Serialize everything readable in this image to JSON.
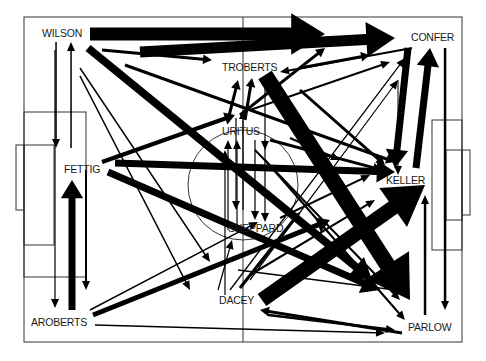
{
  "diagram": {
    "pitch": {
      "outer": [
        24,
        17,
        438,
        325
      ],
      "halfway_x": 243,
      "center": [
        243,
        185
      ],
      "center_radius": 55,
      "left_box": [
        24,
        112,
        62,
        165
      ],
      "left_six": [
        24,
        145,
        30,
        100
      ],
      "left_goal": [
        16,
        145,
        8,
        65
      ],
      "right_box": [
        432,
        120,
        30,
        130
      ],
      "right_six": [
        446,
        150,
        16,
        70
      ],
      "right_goal": [
        462,
        150,
        8,
        65
      ]
    },
    "players": [
      {
        "name": "WILSON",
        "x": 42,
        "y": 27
      },
      {
        "name": "CONFER",
        "x": 411,
        "y": 31
      },
      {
        "name": "TROBERTS",
        "x": 222,
        "y": 61
      },
      {
        "name": "URITUS",
        "x": 222,
        "y": 125
      },
      {
        "name": "FETTIG",
        "x": 64,
        "y": 163
      },
      {
        "name": "KELLER",
        "x": 386,
        "y": 174
      },
      {
        "name": "SHEPPARD",
        "x": 228,
        "y": 222
      },
      {
        "name": "DACEY",
        "x": 219,
        "y": 294
      },
      {
        "name": "AROBERTS",
        "x": 31,
        "y": 316
      },
      {
        "name": "PARLOW",
        "x": 408,
        "y": 321
      }
    ],
    "arrows": [
      {
        "from": [
          90,
          34
        ],
        "to": [
          325,
          34
        ],
        "w": 13
      },
      {
        "from": [
          140,
          52
        ],
        "to": [
          395,
          38
        ],
        "w": 11
      },
      {
        "from": [
          88,
          48
        ],
        "to": [
          372,
          280
        ],
        "w": 8
      },
      {
        "from": [
          102,
          50
        ],
        "to": [
          212,
          60
        ],
        "w": 3
      },
      {
        "from": [
          125,
          65
        ],
        "to": [
          395,
          162
        ],
        "w": 3
      },
      {
        "from": [
          80,
          68
        ],
        "to": [
          210,
          262
        ],
        "w": 1.5
      },
      {
        "from": [
          80,
          76
        ],
        "to": [
          190,
          290
        ],
        "w": 1.5
      },
      {
        "from": [
          56,
          42
        ],
        "to": [
          56,
          148
        ],
        "w": 1.5
      },
      {
        "from": [
          71,
          148
        ],
        "to": [
          71,
          42
        ],
        "w": 1.5
      },
      {
        "from": [
          55,
          50
        ],
        "to": [
          55,
          308
        ],
        "w": 1.2
      },
      {
        "from": [
          102,
          162
        ],
        "to": [
          235,
          115
        ],
        "w": 4
      },
      {
        "from": [
          115,
          163
        ],
        "to": [
          395,
          172
        ],
        "w": 7
      },
      {
        "from": [
          108,
          172
        ],
        "to": [
          380,
          290
        ],
        "w": 7
      },
      {
        "from": [
          72,
          310
        ],
        "to": [
          72,
          180
        ],
        "w": 7
      },
      {
        "from": [
          86,
          170
        ],
        "to": [
          86,
          290
        ],
        "w": 2
      },
      {
        "from": [
          90,
          310
        ],
        "to": [
          258,
          222
        ],
        "w": 1.5
      },
      {
        "from": [
          93,
          315
        ],
        "to": [
          330,
          220
        ],
        "w": 5
      },
      {
        "from": [
          95,
          325
        ],
        "to": [
          385,
          333
        ],
        "w": 1.5
      },
      {
        "from": [
          265,
          75
        ],
        "to": [
          410,
          300
        ],
        "w": 16
      },
      {
        "from": [
          262,
          300
        ],
        "to": [
          425,
          185
        ],
        "w": 15
      },
      {
        "from": [
          238,
          270
        ],
        "to": [
          410,
          292
        ],
        "w": 1.5
      },
      {
        "from": [
          268,
          315
        ],
        "to": [
          395,
          330
        ],
        "w": 2.5
      },
      {
        "from": [
          402,
          333
        ],
        "to": [
          260,
          310
        ],
        "w": 3
      },
      {
        "from": [
          408,
          48
        ],
        "to": [
          395,
          168
        ],
        "w": 7
      },
      {
        "from": [
          416,
          168
        ],
        "to": [
          430,
          48
        ],
        "w": 7
      },
      {
        "from": [
          445,
          48
        ],
        "to": [
          445,
          310
        ],
        "w": 2.5
      },
      {
        "from": [
          425,
          315
        ],
        "to": [
          425,
          195
        ],
        "w": 2.5
      },
      {
        "from": [
          412,
          48
        ],
        "to": [
          280,
          72
        ],
        "w": 2
      },
      {
        "from": [
          300,
          68
        ],
        "to": [
          370,
          55
        ],
        "w": 3
      },
      {
        "from": [
          240,
          115
        ],
        "to": [
          325,
          48
        ],
        "w": 3
      },
      {
        "from": [
          250,
          110
        ],
        "to": [
          390,
          62
        ],
        "w": 2
      },
      {
        "from": [
          230,
          290
        ],
        "to": [
          405,
          58
        ],
        "w": 1.2
      },
      {
        "from": [
          250,
          280
        ],
        "to": [
          398,
          80
        ],
        "w": 1.2
      },
      {
        "from": [
          398,
          80
        ],
        "to": [
          398,
          175
        ],
        "w": 1
      },
      {
        "from": [
          300,
          90
        ],
        "to": [
          385,
          165
        ],
        "w": 3
      },
      {
        "from": [
          270,
          140
        ],
        "to": [
          382,
          170
        ],
        "w": 3
      },
      {
        "from": [
          290,
          138
        ],
        "to": [
          340,
          160
        ],
        "w": 2
      },
      {
        "from": [
          255,
          150
        ],
        "to": [
          400,
          300
        ],
        "w": 2
      },
      {
        "from": [
          265,
          160
        ],
        "to": [
          405,
          320
        ],
        "w": 2
      },
      {
        "from": [
          236,
          118
        ],
        "to": [
          236,
          210
        ],
        "w": 1.2
      },
      {
        "from": [
          243,
          210
        ],
        "to": [
          243,
          110
        ],
        "w": 1.2
      },
      {
        "from": [
          228,
          230
        ],
        "to": [
          228,
          140
        ],
        "w": 1.2
      },
      {
        "from": [
          237,
          225
        ],
        "to": [
          237,
          140
        ],
        "w": 1.2
      },
      {
        "from": [
          255,
          140
        ],
        "to": [
          255,
          220
        ],
        "w": 1.2
      },
      {
        "from": [
          265,
          140
        ],
        "to": [
          265,
          222
        ],
        "w": 1.2
      },
      {
        "from": [
          265,
          82
        ],
        "to": [
          265,
          150
        ],
        "w": 1.2
      },
      {
        "from": [
          228,
          120
        ],
        "to": [
          238,
          80
        ],
        "w": 3
      },
      {
        "from": [
          245,
          120
        ],
        "to": [
          252,
          78
        ],
        "w": 3
      },
      {
        "from": [
          225,
          295
        ],
        "to": [
          225,
          150
        ],
        "w": 1.2
      },
      {
        "from": [
          218,
          290
        ],
        "to": [
          232,
          240
        ],
        "w": 1.2
      },
      {
        "from": [
          240,
          288
        ],
        "to": [
          300,
          212
        ],
        "w": 3
      },
      {
        "from": [
          250,
          275
        ],
        "to": [
          375,
          200
        ],
        "w": 2
      },
      {
        "from": [
          280,
          218
        ],
        "to": [
          370,
          175
        ],
        "w": 2
      }
    ]
  }
}
